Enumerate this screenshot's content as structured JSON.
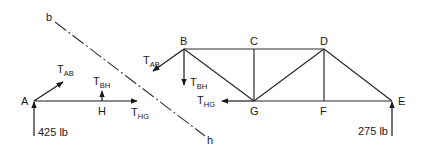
{
  "diagram": {
    "type": "truss-method-of-sections",
    "nodes": {
      "A": {
        "label": "A",
        "x": 34,
        "y": 101
      },
      "H": {
        "label": "H",
        "x": 102,
        "y": 101
      },
      "B": {
        "label": "B",
        "x": 184,
        "y": 49
      },
      "C": {
        "label": "C",
        "x": 254,
        "y": 49
      },
      "D": {
        "label": "D",
        "x": 324,
        "y": 49
      },
      "G": {
        "label": "G",
        "x": 254,
        "y": 101
      },
      "F": {
        "label": "F",
        "x": 324,
        "y": 101
      },
      "E": {
        "label": "E",
        "x": 392,
        "y": 101
      }
    },
    "members": [
      [
        "B",
        "C"
      ],
      [
        "C",
        "D"
      ],
      [
        "G",
        "F"
      ],
      [
        "F",
        "E"
      ],
      [
        "B",
        "G"
      ],
      [
        "C",
        "G"
      ],
      [
        "G",
        "D"
      ],
      [
        "D",
        "F"
      ],
      [
        "D",
        "E"
      ]
    ],
    "section_line": {
      "start_label": "b",
      "end_label": "h"
    },
    "loads": {
      "reaction_A": "425 lb",
      "reaction_E": "275 lb"
    },
    "forces": {
      "left_TAB": {
        "main": "T",
        "sub": "AB"
      },
      "left_TBH": {
        "main": "T",
        "sub": "BH"
      },
      "left_THG": {
        "main": "T",
        "sub": "HG"
      },
      "right_TAB": {
        "main": "T",
        "sub": "AB"
      },
      "right_TBH": {
        "main": "T",
        "sub": "BH"
      },
      "right_THG": {
        "main": "T",
        "sub": "HG"
      }
    }
  }
}
